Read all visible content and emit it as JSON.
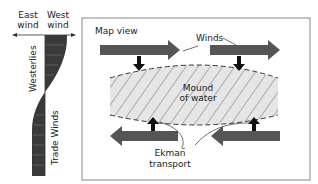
{
  "profile": {
    "east_label_1": "East",
    "east_label_2": "wind",
    "west_label_1": "West",
    "west_label_2": "wind",
    "westerlies": "Westerlies",
    "trade_winds": "Trade Winds"
  },
  "map": {
    "title": "Map view",
    "winds_label": "Winds",
    "mound_label_1": "Mound",
    "mound_label_2": "of water",
    "ekman_label_1": "Ekman",
    "ekman_label_2": "transport"
  },
  "colors": {
    "arrow": "#555555",
    "profile_fill": "#3a3a3a",
    "mound_fill": "#e6e6e6",
    "frame": "#888888"
  }
}
